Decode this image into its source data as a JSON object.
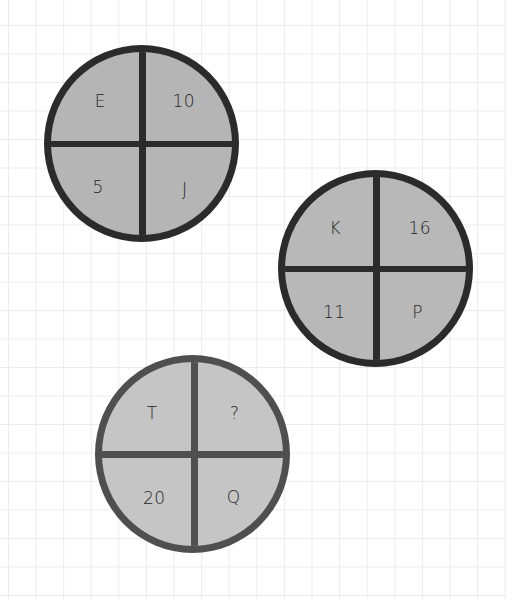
{
  "puzzle": {
    "circles": [
      {
        "id": "circle-1",
        "position": {
          "left": 44,
          "top": 45,
          "diameter": 195
        },
        "fill": "#b5b5b5",
        "border": "#2b2b2b",
        "quadrants": {
          "top_left": "E",
          "top_right": "10",
          "bottom_left": "5",
          "bottom_right": "J"
        }
      },
      {
        "id": "circle-2",
        "position": {
          "left": 278,
          "top": 170,
          "diameter": 195
        },
        "fill": "#b8b8b8",
        "border": "#2b2b2b",
        "quadrants": {
          "top_left": "K",
          "top_right": "16",
          "bottom_left": "11",
          "bottom_right": "P"
        }
      },
      {
        "id": "circle-3",
        "position": {
          "left": 95,
          "top": 355,
          "diameter": 195
        },
        "fill": "#c5c5c5",
        "border": "#4f4f4f",
        "quadrants": {
          "top_left": "T",
          "top_right": "?",
          "bottom_left": "20",
          "bottom_right": "Q"
        }
      }
    ]
  }
}
